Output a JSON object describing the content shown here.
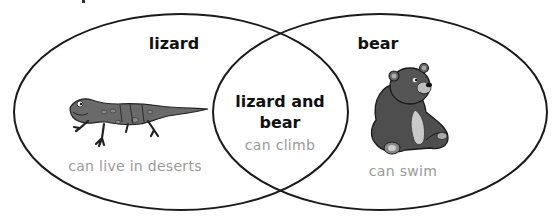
{
  "diagram": {
    "type": "venn",
    "sets": [
      {
        "id": "left",
        "title": "lizard",
        "trait": "can live in deserts",
        "image_icon": "lizard-icon"
      },
      {
        "id": "right",
        "title": "bear",
        "trait": "can swim",
        "image_icon": "bear-icon"
      }
    ],
    "intersection": {
      "title_line1": "lizard and",
      "title_line2": "bear",
      "trait": "can climb"
    },
    "colors": {
      "outline": "#1a1a1a",
      "title_text": "#111111",
      "trait_text": "#9a9a9a",
      "animal_fill": "#5a5a5a",
      "background": "#ffffff"
    }
  }
}
